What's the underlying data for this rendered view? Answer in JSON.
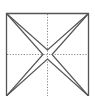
{
  "diagram": {
    "type": "fold-pattern",
    "colors": {
      "stroke": "#555555",
      "dotted": "#777777",
      "background": "#ffffff"
    },
    "square": {
      "x": 6,
      "y": 13,
      "width": 83,
      "height": 83
    },
    "center": {
      "x": 47.5,
      "y": 54.5
    },
    "creases": [
      {
        "name": "vertical-midline",
        "style": "dotted"
      },
      {
        "name": "horizontal-midline",
        "style": "dotted"
      }
    ],
    "folds": [
      {
        "name": "diagonal-top-left-to-bottom-right",
        "style": "solid-pinched"
      },
      {
        "name": "diagonal-top-right-to-bottom-left",
        "style": "solid-pinched"
      }
    ]
  }
}
